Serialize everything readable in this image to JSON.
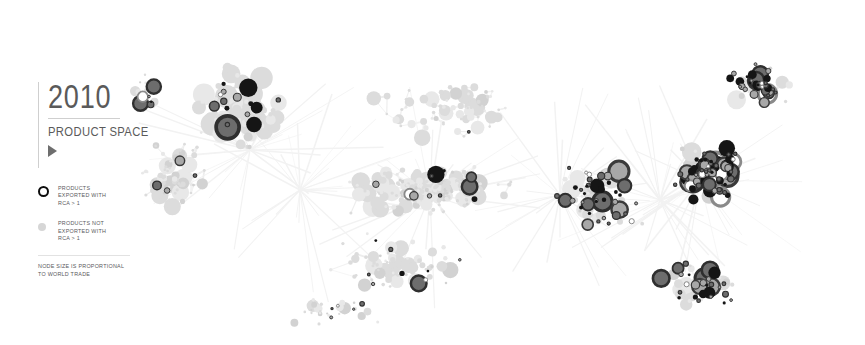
{
  "title": {
    "year": "2010",
    "subtitle": "PRODUCT\nSPACE",
    "play_icon": "play-triangle-icon"
  },
  "legend": {
    "entries": [
      {
        "marker": "black-ring-marker",
        "label": "PRODUCTS\nEXPORTED WITH\nRCA > 1"
      },
      {
        "marker": "gray-dot-marker",
        "label": "PRODUCTS NOT\nEXPORTED WITH\nRCA > 1"
      }
    ],
    "note": "NODE SIZE IS PROPORTIONAL\nTO WORLD TRADE"
  },
  "colors": {
    "background": "#ffffff",
    "rule": "#cfcfcf",
    "title_text": "#5a5a5a",
    "legend_text": "#59595c",
    "edge": "#ededed",
    "edge_faint": "#f2f2f2",
    "node_inactive": "#dcdcdc",
    "node_inactive_light": "#e8e8e8",
    "node_mid": "#9a9a9a",
    "node_dark": "#4a4a4a",
    "node_black": "#151515",
    "ring_stroke": "#2b2b2b"
  },
  "chart_data": {
    "type": "scatter",
    "title": "2010 Product Space",
    "xlabel": "",
    "ylabel": "",
    "xlim": [
      0,
      865
    ],
    "ylim": [
      0,
      345
    ],
    "grid": false,
    "legend_position": "left",
    "series": [
      {
        "name": "Products exported with RCA > 1",
        "marker": "ring",
        "color": "#151515"
      },
      {
        "name": "Products not exported with RCA > 1",
        "marker": "dot",
        "color": "#dcdcdc"
      }
    ],
    "node_size_meaning": "proportional to world trade",
    "node_count": 772,
    "edge_count": 640,
    "clusters": [
      {
        "name": "upper-left-cluster",
        "cx": 240,
        "cy": 110,
        "rx": 90,
        "ry": 75,
        "n": 96,
        "active_ratio": 0.16,
        "size_bias": 1.35
      },
      {
        "name": "left-spray",
        "cx": 175,
        "cy": 175,
        "rx": 70,
        "ry": 95,
        "n": 70,
        "active_ratio": 0.12,
        "size_bias": 0.85
      },
      {
        "name": "central-spine",
        "cx": 430,
        "cy": 190,
        "rx": 150,
        "ry": 45,
        "n": 185,
        "active_ratio": 0.05,
        "size_bias": 0.95
      },
      {
        "name": "mid-upper-scatter",
        "cx": 450,
        "cy": 110,
        "rx": 140,
        "ry": 60,
        "n": 70,
        "active_ratio": 0.1,
        "size_bias": 0.8
      },
      {
        "name": "mid-lower-scatter",
        "cx": 400,
        "cy": 265,
        "rx": 150,
        "ry": 55,
        "n": 78,
        "active_ratio": 0.14,
        "size_bias": 0.8
      },
      {
        "name": "center-right-bridge",
        "cx": 600,
        "cy": 195,
        "rx": 80,
        "ry": 70,
        "n": 80,
        "active_ratio": 0.45,
        "size_bias": 0.95
      },
      {
        "name": "right-dense-cluster",
        "cx": 710,
        "cy": 175,
        "rx": 60,
        "ry": 55,
        "n": 105,
        "active_ratio": 0.78,
        "size_bias": 1.05
      },
      {
        "name": "top-right-cluster",
        "cx": 760,
        "cy": 85,
        "rx": 62,
        "ry": 42,
        "n": 55,
        "active_ratio": 0.62,
        "size_bias": 0.9
      },
      {
        "name": "lower-right-cluster",
        "cx": 700,
        "cy": 285,
        "rx": 70,
        "ry": 45,
        "n": 55,
        "active_ratio": 0.6,
        "size_bias": 0.85
      },
      {
        "name": "far-left-outliers",
        "cx": 145,
        "cy": 95,
        "rx": 35,
        "ry": 50,
        "n": 22,
        "active_ratio": 0.3,
        "size_bias": 0.7
      },
      {
        "name": "bottom-center-tail",
        "cx": 330,
        "cy": 310,
        "rx": 90,
        "ry": 28,
        "n": 30,
        "active_ratio": 0.22,
        "size_bias": 0.7
      }
    ]
  }
}
